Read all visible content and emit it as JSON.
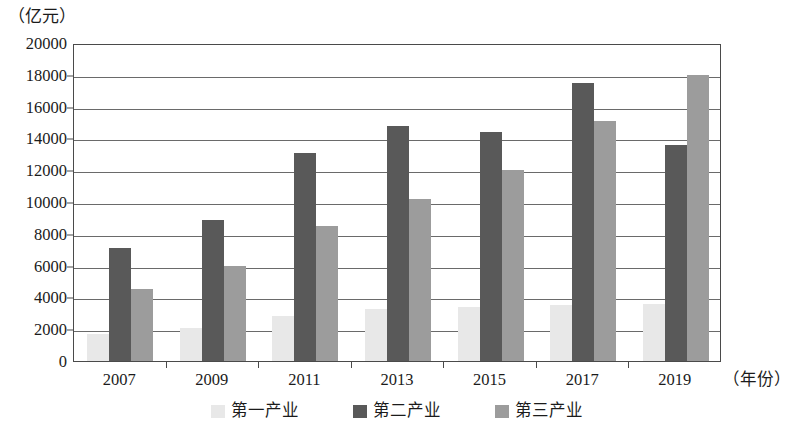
{
  "chart_data": {
    "type": "bar",
    "title": "",
    "subtitle": "",
    "xlabel": "（年份）",
    "ylabel": "（亿元）",
    "categories": [
      "2007",
      "2009",
      "2011",
      "2013",
      "2015",
      "2017",
      "2019"
    ],
    "series": [
      {
        "name": "第一产业",
        "color": "#e8e8e8",
        "values": [
          1700,
          2100,
          2800,
          3300,
          3400,
          3500,
          3600
        ]
      },
      {
        "name": "第二产业",
        "color": "#595959",
        "values": [
          7100,
          8900,
          13100,
          14800,
          14400,
          17500,
          13600
        ]
      },
      {
        "name": "第三产业",
        "color": "#9c9c9c",
        "values": [
          4500,
          6000,
          8500,
          10200,
          12000,
          15100,
          18000
        ]
      }
    ],
    "ylim": [
      0,
      20000
    ],
    "ytick_step": 2000,
    "yticks": [
      0,
      2000,
      4000,
      6000,
      8000,
      10000,
      12000,
      14000,
      16000,
      18000,
      20000
    ],
    "ytick_labels": [
      "0",
      "2000",
      "4000",
      "6000",
      "8000",
      "10000",
      "12000",
      "14000",
      "16000",
      "18000",
      "20000"
    ],
    "grid": true,
    "grid_axis": "y",
    "legend_position": "bottom"
  },
  "axes": {
    "y_unit_caption": "（亿元）",
    "x_unit_caption": "（年份）"
  },
  "legend": {
    "items": [
      {
        "label": "第一产业",
        "color": "#e8e8e8"
      },
      {
        "label": "第二产业",
        "color": "#595959"
      },
      {
        "label": "第三产业",
        "color": "#9c9c9c"
      }
    ]
  },
  "style": {
    "axis_color": "#4a4a4a",
    "grid_color": "#6a6a6a",
    "background": "#ffffff",
    "text_color": "#1b1b1b"
  }
}
